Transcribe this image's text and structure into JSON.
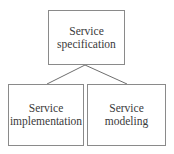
{
  "diagram": {
    "type": "hierarchy",
    "nodes": [
      {
        "id": "service-specification",
        "lines": [
          "Service",
          "specification"
        ]
      },
      {
        "id": "service-implementation",
        "lines": [
          "Service",
          "implementation"
        ]
      },
      {
        "id": "service-modeling",
        "lines": [
          "Service",
          "modeling"
        ]
      }
    ],
    "edges": [
      {
        "from": "service-specification",
        "to": "service-implementation"
      },
      {
        "from": "service-specification",
        "to": "service-modeling"
      }
    ],
    "colors": {
      "border": "#8a8a8a",
      "line": "#6e6e6e",
      "text": "#3a3a3a",
      "background": "#ffffff"
    }
  }
}
